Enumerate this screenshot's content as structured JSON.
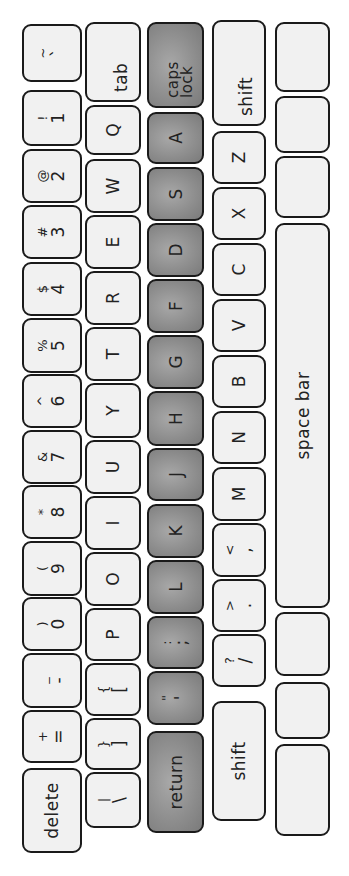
{
  "keyboard": {
    "colors": {
      "key_fill": "#f1f1f1",
      "key_fill_highlight": "#8c8c8c",
      "outline": "#1a1a1a",
      "background": "#ffffff"
    },
    "rows": [
      {
        "name": "number-row",
        "keys": [
          {
            "id": "tilde",
            "top": "~",
            "bot": "`",
            "x": 794,
            "w": 58
          },
          {
            "id": "1",
            "top": "!",
            "bot": "1",
            "x": 730,
            "w": 56
          },
          {
            "id": "2",
            "top": "@",
            "bot": "2",
            "x": 673,
            "w": 54
          },
          {
            "id": "3",
            "top": "#",
            "bot": "3",
            "x": 617,
            "w": 54
          },
          {
            "id": "4",
            "top": "$",
            "bot": "4",
            "x": 560,
            "w": 54
          },
          {
            "id": "5",
            "top": "%",
            "bot": "5",
            "x": 503,
            "w": 55
          },
          {
            "id": "6",
            "top": "^",
            "bot": "6",
            "x": 448,
            "w": 54
          },
          {
            "id": "7",
            "top": "&",
            "bot": "7",
            "x": 392,
            "w": 54
          },
          {
            "id": "8",
            "top": "*",
            "bot": "8",
            "x": 337,
            "w": 54
          },
          {
            "id": "9",
            "top": "(",
            "bot": "9",
            "x": 280,
            "w": 55
          },
          {
            "id": "0",
            "top": ")",
            "bot": "0",
            "x": 225,
            "w": 54
          },
          {
            "id": "minus",
            "top": "_",
            "bot": "-",
            "x": 168,
            "w": 55
          },
          {
            "id": "equals",
            "top": "+",
            "bot": "=",
            "x": 113,
            "w": 53
          },
          {
            "id": "delete",
            "label": "delete",
            "x": 23,
            "w": 85
          }
        ]
      },
      {
        "name": "qwerty-row",
        "keys": [
          {
            "id": "tab",
            "label": "tab",
            "x": 774,
            "w": 80
          },
          {
            "id": "q",
            "label": "Q",
            "x": 721,
            "w": 50
          },
          {
            "id": "w",
            "label": "W",
            "x": 663,
            "w": 54
          },
          {
            "id": "e",
            "label": "E",
            "x": 607,
            "w": 54
          },
          {
            "id": "r",
            "label": "R",
            "x": 551,
            "w": 54
          },
          {
            "id": "t",
            "label": "T",
            "x": 495,
            "w": 54
          },
          {
            "id": "y",
            "label": "Y",
            "x": 438,
            "w": 55
          },
          {
            "id": "u",
            "label": "U",
            "x": 382,
            "w": 54
          },
          {
            "id": "i",
            "label": "I",
            "x": 326,
            "w": 54
          },
          {
            "id": "o",
            "label": "O",
            "x": 270,
            "w": 54
          },
          {
            "id": "p",
            "label": "P",
            "x": 215,
            "w": 53
          },
          {
            "id": "lbracket",
            "top": "{",
            "bot": "[",
            "x": 160,
            "w": 53
          },
          {
            "id": "rbracket",
            "top": "}",
            "bot": "]",
            "x": 106,
            "w": 52
          },
          {
            "id": "backslash",
            "top": "|",
            "bot": "\\",
            "x": 48,
            "w": 56
          }
        ]
      },
      {
        "name": "home-row",
        "keys": [
          {
            "id": "capslock",
            "label": "caps lock",
            "x": 768,
            "w": 86,
            "gray": true
          },
          {
            "id": "a",
            "label": "A",
            "x": 712,
            "w": 52,
            "gray": true
          },
          {
            "id": "s",
            "label": "S",
            "x": 655,
            "w": 54,
            "gray": true
          },
          {
            "id": "d",
            "label": "D",
            "x": 599,
            "w": 54,
            "gray": true
          },
          {
            "id": "f",
            "label": "F",
            "x": 543,
            "w": 54,
            "gray": true
          },
          {
            "id": "g",
            "label": "G",
            "x": 487,
            "w": 54,
            "gray": true
          },
          {
            "id": "h",
            "label": "H",
            "x": 430,
            "w": 55,
            "gray": true
          },
          {
            "id": "j",
            "label": "J",
            "x": 375,
            "w": 53,
            "gray": true
          },
          {
            "id": "k",
            "label": "K",
            "x": 318,
            "w": 54,
            "gray": true
          },
          {
            "id": "l",
            "label": "L",
            "x": 262,
            "w": 54,
            "gray": true
          },
          {
            "id": "semicolon",
            "top": ":",
            "bot": ";",
            "x": 207,
            "w": 53,
            "gray": true
          },
          {
            "id": "quote",
            "top": "\"",
            "bot": "'",
            "x": 151,
            "w": 54,
            "gray": true
          },
          {
            "id": "return",
            "label": "return",
            "x": 43,
            "w": 102,
            "gray": true
          }
        ]
      },
      {
        "name": "bottom-letter-row",
        "keys": [
          {
            "id": "lshift",
            "label": "shift",
            "x": 750,
            "w": 106
          },
          {
            "id": "z",
            "label": "Z",
            "x": 692,
            "w": 53
          },
          {
            "id": "x",
            "label": "X",
            "x": 636,
            "w": 53
          },
          {
            "id": "c",
            "label": "C",
            "x": 580,
            "w": 53
          },
          {
            "id": "v",
            "label": "V",
            "x": 524,
            "w": 53
          },
          {
            "id": "b",
            "label": "B",
            "x": 468,
            "w": 53
          },
          {
            "id": "n",
            "label": "N",
            "x": 412,
            "w": 53
          },
          {
            "id": "m",
            "label": "M",
            "x": 355,
            "w": 54
          },
          {
            "id": "comma",
            "top": "<",
            "bot": ",",
            "x": 299,
            "w": 54
          },
          {
            "id": "period",
            "top": ">",
            "bot": ".",
            "x": 244,
            "w": 53
          },
          {
            "id": "slash",
            "top": "?",
            "bot": "/",
            "x": 189,
            "w": 53
          },
          {
            "id": "rshift",
            "label": "shift",
            "x": 55,
            "w": 120
          }
        ]
      },
      {
        "name": "modifier-row",
        "keys": [
          {
            "id": "blank1",
            "label": "",
            "x": 784,
            "w": 70
          },
          {
            "id": "blank2",
            "label": "",
            "x": 723,
            "w": 57
          },
          {
            "id": "blank3",
            "label": "",
            "x": 658,
            "w": 62
          },
          {
            "id": "spacebar",
            "label": "space bar",
            "x": 268,
            "w": 385
          },
          {
            "id": "blank4",
            "label": "",
            "x": 200,
            "w": 64
          },
          {
            "id": "blank5",
            "label": "",
            "x": 137,
            "w": 57
          },
          {
            "id": "blank6",
            "label": "",
            "x": 40,
            "w": 92
          }
        ]
      }
    ],
    "row_positions": [
      {
        "y": 22,
        "h": 60
      },
      {
        "y": 85,
        "h": 56
      },
      {
        "y": 147,
        "h": 57
      },
      {
        "y": 212,
        "h": 54
      },
      {
        "y": 275,
        "h": 55
      }
    ]
  }
}
